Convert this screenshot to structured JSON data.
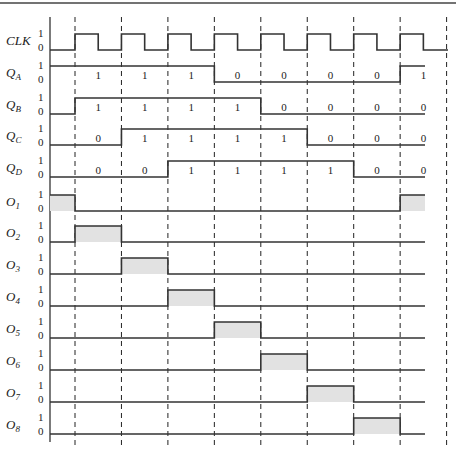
{
  "figure": {
    "type": "timing-diagram",
    "level_labels": {
      "high": "1",
      "low": "0"
    },
    "clock_periods": 8,
    "colors": {
      "line": "#333333",
      "pulse_fill": "#e2e2e2",
      "dashed": "#222222"
    }
  },
  "signals": [
    {
      "name": "CLK",
      "sub": "",
      "kind": "clock"
    },
    {
      "name": "Q",
      "sub": "A",
      "kind": "state",
      "initial": 1,
      "values": [
        "1",
        "1",
        "1",
        "0",
        "0",
        "0",
        "0",
        "1"
      ]
    },
    {
      "name": "Q",
      "sub": "B",
      "kind": "state",
      "initial": 0,
      "values": [
        "1",
        "1",
        "1",
        "1",
        "0",
        "0",
        "0",
        "0"
      ]
    },
    {
      "name": "Q",
      "sub": "C",
      "kind": "state",
      "initial": 0,
      "values": [
        "0",
        "1",
        "1",
        "1",
        "1",
        "0",
        "0",
        "0"
      ]
    },
    {
      "name": "Q",
      "sub": "D",
      "kind": "state",
      "initial": 0,
      "values": [
        "0",
        "0",
        "1",
        "1",
        "1",
        "1",
        "0",
        "0"
      ]
    },
    {
      "name": "O",
      "sub": "1",
      "kind": "output",
      "high_intervals": [
        [
          -1,
          0
        ],
        [
          7,
          8
        ]
      ]
    },
    {
      "name": "O",
      "sub": "2",
      "kind": "output",
      "high_intervals": [
        [
          0,
          1
        ]
      ]
    },
    {
      "name": "O",
      "sub": "3",
      "kind": "output",
      "high_intervals": [
        [
          1,
          2
        ]
      ]
    },
    {
      "name": "O",
      "sub": "4",
      "kind": "output",
      "high_intervals": [
        [
          2,
          3
        ]
      ]
    },
    {
      "name": "O",
      "sub": "5",
      "kind": "output",
      "high_intervals": [
        [
          3,
          4
        ]
      ]
    },
    {
      "name": "O",
      "sub": "6",
      "kind": "output",
      "high_intervals": [
        [
          4,
          5
        ]
      ]
    },
    {
      "name": "O",
      "sub": "7",
      "kind": "output",
      "high_intervals": [
        [
          5,
          6
        ]
      ]
    },
    {
      "name": "O",
      "sub": "8",
      "kind": "output",
      "high_intervals": [
        [
          6,
          7
        ]
      ]
    }
  ]
}
